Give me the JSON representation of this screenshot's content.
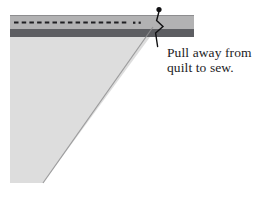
{
  "caption": {
    "line1": "Pull away from",
    "line2": "quilt to sew."
  },
  "icons": {
    "pin": "straight-pin"
  },
  "colors": {
    "background": "#ffffff",
    "binding_strip": "#b2b2b3",
    "binding_strip_edge": "#8d8d8f",
    "seam_band": "#5d5e62",
    "quilt": "#dddddd",
    "quilt_edge": "#8f8f91",
    "stitch": "#1f1f22",
    "pin": "#101012",
    "text": "#1c1c1e"
  }
}
